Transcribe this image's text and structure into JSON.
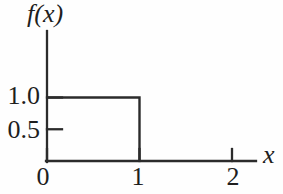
{
  "figure": {
    "background": "#fefefe",
    "ink_color": "#2b2b2b"
  },
  "chart_data": {
    "type": "line",
    "subtype": "step-function-pdf",
    "title": "",
    "xlabel": "x",
    "ylabel": "f(x)",
    "x_ticks": [
      {
        "value": 0,
        "label": "0"
      },
      {
        "value": 1,
        "label": "1"
      },
      {
        "value": 2,
        "label": "2"
      }
    ],
    "y_ticks": [
      {
        "value": 0.5,
        "label": "0.5"
      },
      {
        "value": 1.0,
        "label": "1.0"
      }
    ],
    "xlim": [
      0,
      2.26
    ],
    "ylim": [
      0,
      2.06
    ],
    "grid": false,
    "legend": false,
    "series": [
      {
        "name": "f(x)",
        "points": [
          [
            0,
            1
          ],
          [
            1,
            1
          ],
          [
            1,
            0
          ]
        ]
      }
    ]
  }
}
